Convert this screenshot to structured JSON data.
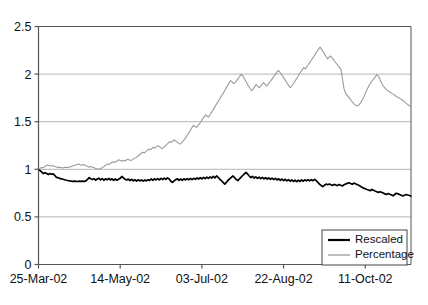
{
  "chart_data": {
    "type": "line",
    "title": "",
    "xlabel": "",
    "ylabel": "",
    "ylim": [
      0,
      2.5
    ],
    "yticks": [
      0,
      0.5,
      1,
      1.5,
      2,
      2.5
    ],
    "ytick_labels": [
      "0",
      "0.5",
      "1",
      "1.5",
      "2",
      "2.5"
    ],
    "xtick_labels": [
      "25-Mar-02",
      "14-May-02",
      "03-Jul-02",
      "22-Aug-02",
      "11-Oct-02"
    ],
    "xtick_positions": [
      0,
      50,
      100,
      150,
      200
    ],
    "xlim": [
      0,
      228
    ],
    "grid": "horizontal",
    "legend_position": "bottom-right",
    "colors": {
      "rescaled": "#000000",
      "percentage": "#9a9a9a",
      "grid": "#b4b4b4",
      "axis": "#555555",
      "background": "#ffffff"
    },
    "series": [
      {
        "name": "Rescaled",
        "color": "#000000",
        "values": [
          1.0,
          0.985,
          0.97,
          0.955,
          0.965,
          0.955,
          0.945,
          0.955,
          0.948,
          0.952,
          0.935,
          0.915,
          0.912,
          0.905,
          0.9,
          0.895,
          0.89,
          0.885,
          0.882,
          0.878,
          0.876,
          0.874,
          0.876,
          0.874,
          0.872,
          0.875,
          0.873,
          0.876,
          0.874,
          0.878,
          0.895,
          0.912,
          0.9,
          0.892,
          0.902,
          0.885,
          0.9,
          0.905,
          0.888,
          0.902,
          0.885,
          0.9,
          0.89,
          0.905,
          0.888,
          0.9,
          0.885,
          0.898,
          0.885,
          0.895,
          0.905,
          0.925,
          0.91,
          0.895,
          0.888,
          0.898,
          0.882,
          0.895,
          0.878,
          0.89,
          0.876,
          0.89,
          0.878,
          0.888,
          0.876,
          0.888,
          0.878,
          0.89,
          0.882,
          0.9,
          0.885,
          0.9,
          0.888,
          0.902,
          0.89,
          0.905,
          0.892,
          0.908,
          0.895,
          0.91,
          0.898,
          0.875,
          0.862,
          0.878,
          0.89,
          0.9,
          0.885,
          0.898,
          0.885,
          0.9,
          0.888,
          0.902,
          0.89,
          0.905,
          0.892,
          0.905,
          0.895,
          0.91,
          0.898,
          0.912,
          0.9,
          0.915,
          0.902,
          0.918,
          0.905,
          0.92,
          0.908,
          0.925,
          0.91,
          0.93,
          0.915,
          0.895,
          0.88,
          0.862,
          0.845,
          0.862,
          0.885,
          0.9,
          0.915,
          0.93,
          0.912,
          0.895,
          0.88,
          0.9,
          0.918,
          0.935,
          0.952,
          0.968,
          0.95,
          0.93,
          0.912,
          0.925,
          0.908,
          0.92,
          0.905,
          0.918,
          0.902,
          0.915,
          0.9,
          0.912,
          0.898,
          0.91,
          0.895,
          0.908,
          0.892,
          0.905,
          0.888,
          0.9,
          0.885,
          0.898,
          0.882,
          0.895,
          0.878,
          0.892,
          0.875,
          0.888,
          0.872,
          0.885,
          0.87,
          0.885,
          0.872,
          0.888,
          0.875,
          0.89,
          0.878,
          0.892,
          0.878,
          0.892,
          0.88,
          0.895,
          0.88,
          0.862,
          0.845,
          0.83,
          0.818,
          0.832,
          0.845,
          0.838,
          0.845,
          0.838,
          0.83,
          0.842,
          0.835,
          0.828,
          0.84,
          0.832,
          0.825,
          0.838,
          0.845,
          0.852,
          0.858,
          0.85,
          0.842,
          0.855,
          0.848,
          0.84,
          0.832,
          0.822,
          0.812,
          0.802,
          0.795,
          0.788,
          0.782,
          0.775,
          0.788,
          0.78,
          0.772,
          0.765,
          0.758,
          0.765,
          0.758,
          0.75,
          0.742,
          0.735,
          0.745,
          0.738,
          0.73,
          0.722,
          0.735,
          0.748,
          0.742,
          0.735,
          0.728,
          0.72,
          0.728,
          0.735,
          0.73,
          0.725,
          0.72
        ]
      },
      {
        "name": "Percentage",
        "color": "#9a9a9a",
        "values": [
          1.0,
          1.01,
          1.02,
          1.015,
          1.025,
          1.035,
          1.045,
          1.04,
          1.035,
          1.04,
          1.035,
          1.03,
          1.025,
          1.02,
          1.022,
          1.018,
          1.015,
          1.018,
          1.022,
          1.018,
          1.02,
          1.025,
          1.03,
          1.035,
          1.04,
          1.045,
          1.05,
          1.055,
          1.048,
          1.042,
          1.05,
          1.045,
          1.038,
          1.03,
          1.022,
          1.03,
          1.025,
          1.018,
          1.01,
          1.005,
          0.998,
          1.005,
          1.012,
          1.02,
          1.03,
          1.042,
          1.055,
          1.048,
          1.06,
          1.072,
          1.08,
          1.072,
          1.082,
          1.09,
          1.1,
          1.092,
          1.085,
          1.095,
          1.088,
          1.098,
          1.105,
          1.098,
          1.092,
          1.102,
          1.112,
          1.12,
          1.13,
          1.142,
          1.155,
          1.168,
          1.18,
          1.172,
          1.185,
          1.198,
          1.212,
          1.205,
          1.218,
          1.232,
          1.222,
          1.235,
          1.248,
          1.24,
          1.228,
          1.218,
          1.23,
          1.245,
          1.26,
          1.275,
          1.29,
          1.282,
          1.295,
          1.31,
          1.298,
          1.285,
          1.272,
          1.265,
          1.278,
          1.295,
          1.315,
          1.338,
          1.36,
          1.385,
          1.41,
          1.438,
          1.462,
          1.452,
          1.44,
          1.458,
          1.478,
          1.5,
          1.525,
          1.548,
          1.572,
          1.56,
          1.548,
          1.57,
          1.595,
          1.62,
          1.648,
          1.672,
          1.698,
          1.722,
          1.748,
          1.775,
          1.8,
          1.828,
          1.855,
          1.882,
          1.908,
          1.932,
          1.918,
          1.9,
          1.912,
          1.932,
          1.952,
          1.975,
          2.0,
          1.982,
          1.958,
          1.93,
          1.9,
          1.872,
          1.848,
          1.825,
          1.842,
          1.868,
          1.89,
          1.875,
          1.855,
          1.872,
          1.892,
          1.912,
          1.895,
          1.875,
          1.89,
          1.912,
          1.932,
          1.955,
          1.978,
          2.0,
          2.02,
          2.038,
          2.02,
          1.998,
          1.975,
          1.95,
          1.925,
          1.9,
          1.878,
          1.858,
          1.875,
          1.898,
          1.922,
          1.948,
          1.972,
          1.998,
          2.022,
          2.045,
          2.068,
          2.055,
          2.075,
          2.098,
          2.12,
          2.145,
          2.168,
          2.19,
          2.215,
          2.24,
          2.262,
          2.285,
          2.26,
          2.235,
          2.21,
          2.185,
          2.16,
          2.175,
          2.19,
          2.17,
          2.15,
          2.13,
          2.11,
          2.09,
          2.07,
          2.05,
          1.95,
          1.85,
          1.8,
          1.78,
          1.76,
          1.74,
          1.72,
          1.7,
          1.685,
          1.672,
          1.668,
          1.675,
          1.695,
          1.72,
          1.75,
          1.785,
          1.82,
          1.855,
          1.885,
          1.91,
          1.93,
          1.95,
          1.97,
          1.995,
          1.98,
          1.95,
          1.915,
          1.885,
          1.862,
          1.845,
          1.832,
          1.82,
          1.81,
          1.8,
          1.79,
          1.778,
          1.768,
          1.758,
          1.75,
          1.74,
          1.73,
          1.718,
          1.705,
          1.69,
          1.678,
          1.668,
          1.66
        ]
      }
    ]
  },
  "legend": {
    "entries": [
      {
        "label": "Rescaled",
        "color": "#000000"
      },
      {
        "label": "Percentage",
        "color": "#9a9a9a"
      }
    ]
  }
}
